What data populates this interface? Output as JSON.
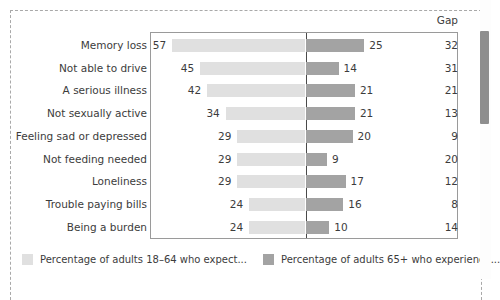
{
  "frame": {
    "gap_header": "Gap"
  },
  "legend": {
    "items": [
      {
        "swatch": "light",
        "label": "Percentage of adults 18–64 who expect..."
      },
      {
        "swatch": "dark",
        "label": "Percentage of adults 65+ who experience..."
      }
    ]
  },
  "colors": {
    "bar_left": "#e0e0e0",
    "bar_right": "#a3a3a3",
    "axis": "#4a4a4a",
    "frame_border": "#9a9a9a",
    "dashed_border": "#a9a9a9",
    "text": "#3c3c3c",
    "scrollbar_thumb": "#8e8e8e"
  },
  "scrollbar": {
    "name": "vertical-scrollbar"
  },
  "chart_data": {
    "type": "bar",
    "title": "",
    "subtitle": "",
    "xlabel": "",
    "ylabel": "",
    "orientation": "horizontal",
    "style": "diverging-tornado",
    "grid": false,
    "legend_position": "bottom-left",
    "axis_center_value": 0,
    "px_per_unit": 2.33,
    "categories": [
      "Memory loss",
      "Not able to drive",
      "A serious illness",
      "Not sexually active",
      "Feeling sad or depressed",
      "Not feeding needed",
      "Loneliness",
      "Trouble paying bills",
      "Being a burden"
    ],
    "series": [
      {
        "name": "Percentage of adults 18–64 who expect...",
        "side": "left",
        "color": "#e0e0e0",
        "values": [
          57,
          45,
          42,
          34,
          29,
          29,
          29,
          24,
          24
        ]
      },
      {
        "name": "Percentage of adults 65+ who experience...",
        "side": "right",
        "color": "#a3a3a3",
        "values": [
          25,
          14,
          21,
          21,
          20,
          9,
          17,
          16,
          10
        ]
      }
    ],
    "gap_column": {
      "header": "Gap",
      "values": [
        32,
        31,
        21,
        13,
        9,
        20,
        12,
        8,
        14
      ]
    },
    "rows": [
      {
        "category": "Memory loss",
        "left": 57,
        "right": 25,
        "gap": 32
      },
      {
        "category": "Not able to drive",
        "left": 45,
        "right": 14,
        "gap": 31
      },
      {
        "category": "A serious illness",
        "left": 42,
        "right": 21,
        "gap": 21
      },
      {
        "category": "Not sexually active",
        "left": 34,
        "right": 21,
        "gap": 13
      },
      {
        "category": "Feeling sad or depressed",
        "left": 29,
        "right": 20,
        "gap": 9
      },
      {
        "category": "Not feeding needed",
        "left": 29,
        "right": 9,
        "gap": 20
      },
      {
        "category": "Loneliness",
        "left": 29,
        "right": 17,
        "gap": 12
      },
      {
        "category": "Trouble paying bills",
        "left": 24,
        "right": 16,
        "gap": 8
      },
      {
        "category": "Being a burden",
        "left": 24,
        "right": 10,
        "gap": 14
      }
    ]
  }
}
